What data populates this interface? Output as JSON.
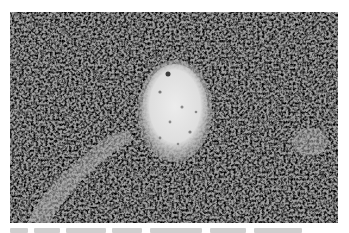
{
  "figure": {
    "type": "histology-micrograph",
    "stain": "grayscale",
    "colors": {
      "background": "#ffffff",
      "tissue_mid": "#8a8a8a",
      "nucleus_dark": "#3a3a3a",
      "cytoplasm_light": "#b8b8b8",
      "lumen": "#e6e6e6"
    },
    "features": [
      {
        "name": "central-vessel-lumen",
        "shape": "oval",
        "cx": 175,
        "cy": 111,
        "rx": 34,
        "ry": 48
      },
      {
        "name": "lower-left-pale-band",
        "shape": "band"
      },
      {
        "name": "right-pale-patch",
        "shape": "patch"
      }
    ]
  },
  "caption": {
    "visible": true,
    "truncated": true,
    "text": ""
  }
}
